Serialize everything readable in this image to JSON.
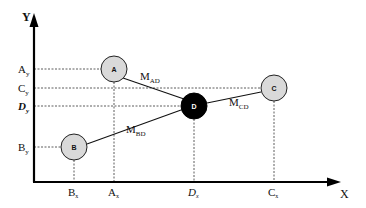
{
  "diagram": {
    "type": "coordinate-network",
    "axes": {
      "x_label": "X",
      "y_label": "Y"
    },
    "nodes": [
      {
        "id": "A",
        "label": "A",
        "cx": 114,
        "cy": 69,
        "fill": "#d9d9d9",
        "text_color": "#111111",
        "x_tick": "A",
        "x_sub": "x",
        "y_tick": "A",
        "y_sub": "y"
      },
      {
        "id": "B",
        "label": "B",
        "cx": 74,
        "cy": 147,
        "fill": "#d9d9d9",
        "text_color": "#111111",
        "x_tick": "B",
        "x_sub": "x",
        "y_tick": "B",
        "y_sub": "y"
      },
      {
        "id": "C",
        "label": "C",
        "cx": 274,
        "cy": 88,
        "fill": "#d9d9d9",
        "text_color": "#111111",
        "x_tick": "C",
        "x_sub": "x",
        "y_tick": "C",
        "y_sub": "y"
      },
      {
        "id": "D",
        "label": "D",
        "cx": 194,
        "cy": 106,
        "fill": "#000000",
        "text_color": "#ffffff",
        "x_tick": "D",
        "x_sub": "x",
        "y_tick": "D",
        "y_sub": "y",
        "italic": true
      }
    ],
    "edges": [
      {
        "from": "A",
        "to": "D",
        "label": "M",
        "sub": "AD"
      },
      {
        "from": "B",
        "to": "D",
        "label": "M",
        "sub": "BD"
      },
      {
        "from": "C",
        "to": "D",
        "label": "M",
        "sub": "CD"
      }
    ]
  }
}
